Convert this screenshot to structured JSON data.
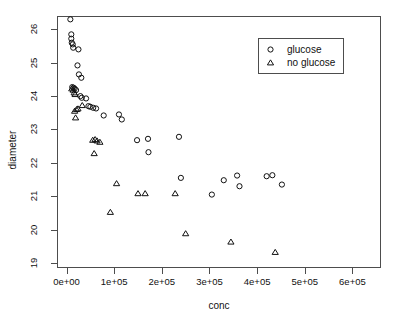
{
  "chart_data": {
    "type": "scatter",
    "title": "",
    "xlabel": "conc",
    "ylabel": "diameter",
    "xlim": [
      -20000,
      660000
    ],
    "ylim": [
      18.85,
      26.4
    ],
    "grid": false,
    "xticks": [
      0,
      100000,
      200000,
      300000,
      400000,
      500000,
      600000
    ],
    "xticklabels": [
      "0e+00",
      "1e+05",
      "2e+05",
      "3e+05",
      "4e+05",
      "5e+05",
      "6e+05"
    ],
    "yticks": [
      19,
      20,
      21,
      22,
      23,
      24,
      25,
      26
    ],
    "yticklabels": [
      "19",
      "20",
      "21",
      "22",
      "23",
      "24",
      "25",
      "26"
    ],
    "legend": {
      "position": "top-right",
      "entries": [
        {
          "label": "glucose",
          "marker": "circle"
        },
        {
          "label": "no glucose",
          "marker": "triangle"
        }
      ]
    },
    "series": [
      {
        "name": "glucose",
        "marker": "circle",
        "points": [
          [
            8000,
            26.3
          ],
          [
            10000,
            25.85
          ],
          [
            10000,
            25.72
          ],
          [
            11000,
            25.6
          ],
          [
            13000,
            25.55
          ],
          [
            14000,
            25.45
          ],
          [
            25000,
            25.4
          ],
          [
            23000,
            24.92
          ],
          [
            26000,
            24.65
          ],
          [
            31000,
            24.55
          ],
          [
            12000,
            24.27
          ],
          [
            15000,
            24.25
          ],
          [
            17000,
            24.22
          ],
          [
            20000,
            24.18
          ],
          [
            29000,
            24.0
          ],
          [
            32000,
            23.95
          ],
          [
            41000,
            23.93
          ],
          [
            46000,
            23.7
          ],
          [
            50000,
            23.68
          ],
          [
            56000,
            23.65
          ],
          [
            62000,
            23.63
          ],
          [
            78000,
            23.42
          ],
          [
            110000,
            23.45
          ],
          [
            116000,
            23.3
          ],
          [
            148000,
            22.68
          ],
          [
            171000,
            22.72
          ],
          [
            172000,
            22.32
          ],
          [
            236000,
            22.78
          ],
          [
            240000,
            21.55
          ],
          [
            305000,
            21.05
          ],
          [
            330000,
            21.48
          ],
          [
            358000,
            21.62
          ],
          [
            363000,
            21.3
          ],
          [
            420000,
            21.6
          ],
          [
            432000,
            21.63
          ],
          [
            452000,
            21.35
          ]
        ]
      },
      {
        "name": "no glucose",
        "marker": "triangle",
        "points": [
          [
            11000,
            24.22
          ],
          [
            14000,
            24.18
          ],
          [
            16000,
            24.1
          ],
          [
            18000,
            24.05
          ],
          [
            33000,
            23.72
          ],
          [
            17000,
            23.55
          ],
          [
            21000,
            23.6
          ],
          [
            24000,
            23.62
          ],
          [
            19000,
            23.35
          ],
          [
            55000,
            22.68
          ],
          [
            60000,
            22.7
          ],
          [
            64000,
            22.66
          ],
          [
            70000,
            22.62
          ],
          [
            58000,
            22.28
          ],
          [
            105000,
            21.38
          ],
          [
            150000,
            21.08
          ],
          [
            165000,
            21.08
          ],
          [
            92000,
            20.52
          ],
          [
            228000,
            21.08
          ],
          [
            250000,
            19.88
          ],
          [
            345000,
            19.63
          ],
          [
            438000,
            19.32
          ]
        ]
      }
    ]
  },
  "axes": {
    "xlabel": "conc",
    "ylabel": "diameter"
  }
}
